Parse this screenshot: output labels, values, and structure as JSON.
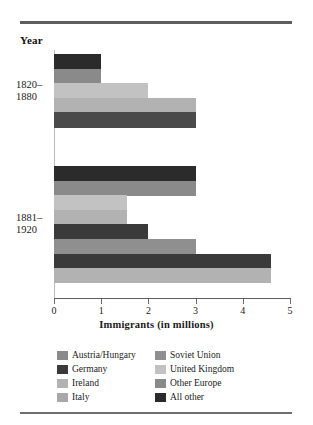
{
  "figure": {
    "year_header": "Year",
    "axis_title": "Immigrants (in millions)"
  },
  "chart_data": {
    "type": "bar",
    "orientation": "horizontal",
    "title": "",
    "xlabel": "Immigrants (in millions)",
    "ylabel": "Year",
    "xlim": [
      0,
      5
    ],
    "xticks": [
      "0",
      "1",
      "2",
      "3",
      "4",
      "5"
    ],
    "grid": false,
    "legend_position": "bottom",
    "categories": [
      "1820–1880",
      "1881–1920"
    ],
    "series": [
      {
        "name": "Austria/Hungary",
        "color": "#8a8a8a",
        "values": [
          0.0,
          4.6
        ]
      },
      {
        "name": "Germany",
        "color": "#3a3a3a",
        "values": [
          0.0,
          4.6
        ]
      },
      {
        "name": "Ireland",
        "color": "#b2b2b2",
        "values": [
          3.0,
          3.0
        ]
      },
      {
        "name": "Italy",
        "color": "#a8a8a8",
        "values": [
          0.0,
          2.0
        ]
      },
      {
        "name": "Soviet Union",
        "color": "#8f8f8f",
        "values": [
          0.0,
          1.55
        ]
      },
      {
        "name": "United Kingdom",
        "color": "#c2c2c2",
        "values": [
          3.0,
          1.55
        ]
      },
      {
        "name": "Other Europe",
        "color": "#8a8a8a",
        "values": [
          2.0,
          3.0
        ]
      },
      {
        "name": "All other",
        "color": "#2b2b2b",
        "values": [
          1.0,
          3.0
        ]
      }
    ],
    "bars": [
      {
        "group": "1820–1880",
        "series": "All other",
        "value": 1.0,
        "color": "#2b2b2b"
      },
      {
        "group": "1820–1880",
        "series": "Other Europe",
        "value": 1.0,
        "color": "#8a8a8a"
      },
      {
        "group": "1820–1880",
        "series": "United Kingdom",
        "value": 2.0,
        "color": "#c2c2c2"
      },
      {
        "group": "1820–1880",
        "series": "Ireland",
        "value": 3.0,
        "color": "#b2b2b2"
      },
      {
        "group": "1820–1880",
        "series": "Germany",
        "value": 3.0,
        "color": "#4a4a4a"
      },
      {
        "group": "1881–1920",
        "series": "All other",
        "value": 3.0,
        "color": "#2b2b2b"
      },
      {
        "group": "1881–1920",
        "series": "Other Europe",
        "value": 3.0,
        "color": "#8a8a8a"
      },
      {
        "group": "1881–1920",
        "series": "United Kingdom",
        "value": 1.55,
        "color": "#c2c2c2"
      },
      {
        "group": "1881–1920",
        "series": "Soviet Union",
        "value": 1.55,
        "color": "#b2b2b2"
      },
      {
        "group": "1881–1920",
        "series": "Italy",
        "value": 2.0,
        "color": "#3a3a3a"
      },
      {
        "group": "1881–1920",
        "series": "Ireland",
        "value": 3.0,
        "color": "#8f8f8f"
      },
      {
        "group": "1881–1920",
        "series": "Germany",
        "value": 4.6,
        "color": "#3a3a3a"
      },
      {
        "group": "1881–1920",
        "series": "Austria/Hungary",
        "value": 4.6,
        "color": "#b2b2b2"
      }
    ]
  },
  "group_labels": [
    {
      "line1": "1820–",
      "line2": "1880"
    },
    {
      "line1": "1881–",
      "line2": "1920"
    }
  ],
  "legend": {
    "items": [
      {
        "label": "Austria/Hungary",
        "color": "#8a8a8a"
      },
      {
        "label": "Soviet Union",
        "color": "#8f8f8f"
      },
      {
        "label": "Germany",
        "color": "#3a3a3a"
      },
      {
        "label": "United Kingdom",
        "color": "#c2c2c2"
      },
      {
        "label": "Ireland",
        "color": "#b2b2b2"
      },
      {
        "label": "Other Europe",
        "color": "#8a8a8a"
      },
      {
        "label": "Italy",
        "color": "#a8a8a8"
      },
      {
        "label": "All other",
        "color": "#2b2b2b"
      }
    ]
  }
}
